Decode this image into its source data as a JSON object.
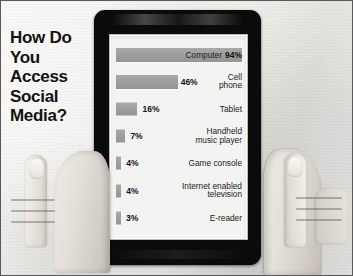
{
  "headline": {
    "lines": [
      "How Do",
      "You",
      "Access",
      "Social",
      "Media?"
    ]
  },
  "device": {
    "name": "tablet"
  },
  "chart_data": {
    "type": "bar",
    "orientation": "horizontal",
    "title": "How Do You Access Social Media?",
    "xlabel": "",
    "ylabel": "",
    "xlim": [
      0,
      100
    ],
    "grid": false,
    "legend": null,
    "value_suffix": "%",
    "categories": [
      "Computer",
      "Cell phone",
      "Tablet",
      "Handheld music player",
      "Game console",
      "Internet enabled television",
      "E-reader"
    ],
    "values": [
      94,
      46,
      16,
      7,
      4,
      4,
      3
    ],
    "labels": [
      "94%",
      "46%",
      "16%",
      "7%",
      "4%",
      "4%",
      "3%"
    ],
    "category_lines": [
      [
        "Computer"
      ],
      [
        "Cell",
        "phone"
      ],
      [
        "Tablet"
      ],
      [
        "Handheld",
        "music player"
      ],
      [
        "Game console"
      ],
      [
        "Internet enabled",
        "television"
      ],
      [
        "E-reader"
      ]
    ],
    "bar_color": "#9d9d9b",
    "background": "#f3f3f1",
    "text_color": "#1b1b1b"
  }
}
